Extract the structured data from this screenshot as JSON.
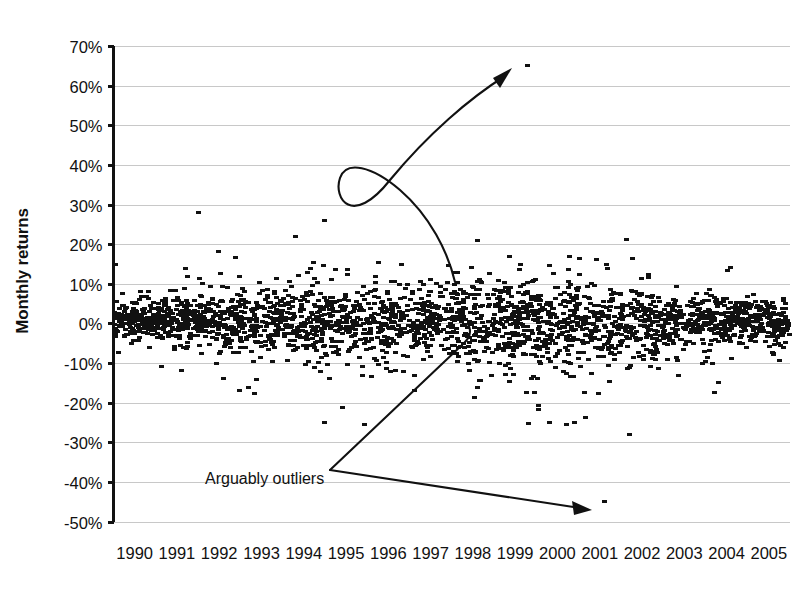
{
  "chart_data": {
    "type": "scatter",
    "title": "",
    "xlabel": "",
    "ylabel": "Monthly returns",
    "xlim": [
      1990,
      2006
    ],
    "ylim": [
      -0.5,
      0.7
    ],
    "grid": true,
    "legend": false,
    "legend_position": "none",
    "y_tick_labels": [
      "70%",
      "60%",
      "50%",
      "40%",
      "30%",
      "20%",
      "10%",
      "0%",
      "-10%",
      "-20%",
      "-30%",
      "-40%",
      "-50%"
    ],
    "y_tick_values": [
      0.7,
      0.6,
      0.5,
      0.4,
      0.3,
      0.2,
      0.1,
      0.0,
      -0.1,
      -0.2,
      -0.3,
      -0.4,
      -0.5
    ],
    "x_tick_labels": [
      "1990",
      "1991",
      "1992",
      "1993",
      "1994",
      "1995",
      "1996",
      "1997",
      "1998",
      "1999",
      "2000",
      "2001",
      "2002",
      "2003",
      "2004",
      "2005"
    ],
    "x_tick_values": [
      1990,
      1991,
      1992,
      1993,
      1994,
      1995,
      1996,
      1997,
      1998,
      1999,
      2000,
      2001,
      2002,
      2003,
      2004,
      2005
    ],
    "marker": "small filled rectangle",
    "marker_color": "#111111",
    "series": [
      {
        "name": "Monthly returns",
        "description": "Dense cloud of monthly return observations centered near 0% with roughly +/-7% spread, plus sparse extremes.",
        "center_pct": 0.5,
        "typical_band_pct": [
          -7,
          8
        ],
        "n_points_approx": 2600
      }
    ],
    "notable_outliers": [
      {
        "label": "high outlier",
        "x": 1999.8,
        "y_pct": 65
      },
      {
        "label": "high outlier",
        "x": 1992.0,
        "y_pct": 28
      },
      {
        "label": "high outlier",
        "x": 1995.0,
        "y_pct": 26
      },
      {
        "label": "high outlier",
        "x": 1994.3,
        "y_pct": 22
      },
      {
        "label": "high outlier",
        "x": 1998.6,
        "y_pct": 21
      },
      {
        "label": "low outlier",
        "x": 2001.6,
        "y_pct": -45
      },
      {
        "label": "low outlier",
        "x": 1995.0,
        "y_pct": -25
      },
      {
        "label": "low outlier",
        "x": 2000.3,
        "y_pct": -25
      },
      {
        "label": "low outlier",
        "x": 2000.9,
        "y_pct": -25
      },
      {
        "label": "low outlier",
        "x": 2002.2,
        "y_pct": -28
      }
    ],
    "annotations": [
      {
        "text": "Arguably outliers",
        "text_x_px": 205,
        "text_y_px": 478,
        "points_to": [
          "65% observation near 1999-2000",
          "-45% observation near 2001-2002"
        ],
        "arrow_style": "two curved arrows from a single label"
      }
    ]
  },
  "axes": {
    "y_axis_label": "Monthly returns",
    "y_axis_units": "percent",
    "x_axis_label": ""
  },
  "colors": {
    "marker": "#111111",
    "gridline": "#c8c8c8",
    "axis": "#111111",
    "background": "#ffffff",
    "annotation": "#111111"
  }
}
